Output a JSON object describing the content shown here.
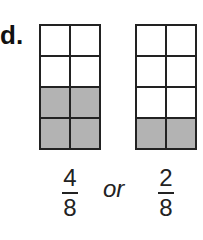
{
  "problem": {
    "label": "d.",
    "connector": "or"
  },
  "grids": [
    {
      "rows": 4,
      "cols": 2,
      "shaded_cells": [
        [
          2,
          0
        ],
        [
          2,
          1
        ],
        [
          3,
          0
        ],
        [
          3,
          1
        ]
      ],
      "fraction": {
        "numerator": "4",
        "denominator": "8"
      }
    },
    {
      "rows": 4,
      "cols": 2,
      "shaded_cells": [
        [
          3,
          0
        ],
        [
          3,
          1
        ]
      ],
      "fraction": {
        "numerator": "2",
        "denominator": "8"
      }
    }
  ],
  "colors": {
    "shaded": "#b3b3b3",
    "line": "#222222",
    "background": "#ffffff"
  }
}
